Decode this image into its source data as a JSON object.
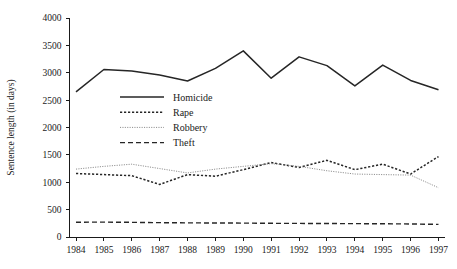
{
  "chart_data": {
    "type": "line",
    "title": "",
    "xlabel": "",
    "ylabel": "Sentence length (in days)",
    "categories": [
      "1984",
      "1985",
      "1986",
      "1987",
      "1988",
      "1989",
      "1990",
      "1991",
      "1992",
      "1993",
      "1994",
      "1995",
      "1996",
      "1997"
    ],
    "x": [
      1984,
      1985,
      1986,
      1987,
      1988,
      1989,
      1990,
      1991,
      1992,
      1993,
      1994,
      1995,
      1996,
      1997
    ],
    "xlim": [
      1984,
      1997
    ],
    "ylim": [
      0,
      4000
    ],
    "yticks": [
      0,
      500,
      1000,
      1500,
      2000,
      2500,
      3000,
      3500,
      4000
    ],
    "ytick_labels": [
      "0",
      "500",
      "1000",
      "1500",
      "2000",
      "2500",
      "3000",
      "3500",
      "4000"
    ],
    "grid": false,
    "legend_position": "inside-upper-left",
    "series": [
      {
        "name": "Homicide",
        "style": "solid",
        "color": "#262626",
        "values": [
          2650,
          3060,
          3030,
          2960,
          2850,
          3080,
          3400,
          2900,
          3290,
          3130,
          2760,
          3140,
          2860,
          2690
        ]
      },
      {
        "name": "Rape",
        "style": "dotted",
        "color": "#262626",
        "values": [
          1160,
          1140,
          1120,
          960,
          1140,
          1110,
          1230,
          1360,
          1270,
          1400,
          1230,
          1330,
          1150,
          1470
        ]
      },
      {
        "name": "Robbery",
        "style": "fine-dotted",
        "color": "#8c8c8c",
        "values": [
          1240,
          1290,
          1330,
          1250,
          1170,
          1240,
          1290,
          1340,
          1290,
          1210,
          1150,
          1140,
          1130,
          900
        ]
      },
      {
        "name": "Theft",
        "style": "dashed",
        "color": "#262626",
        "values": [
          270,
          272,
          268,
          262,
          258,
          256,
          254,
          250,
          248,
          246,
          244,
          242,
          238,
          230
        ]
      }
    ]
  },
  "legend": {
    "items": [
      {
        "label": "Homicide"
      },
      {
        "label": "Rape"
      },
      {
        "label": "Robbery"
      },
      {
        "label": "Theft"
      }
    ]
  }
}
